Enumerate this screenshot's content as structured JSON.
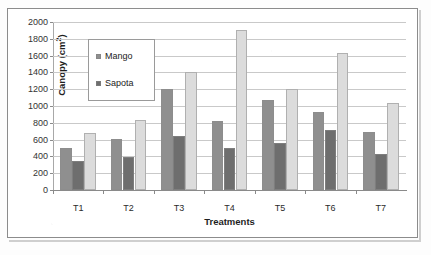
{
  "chart_data": {
    "type": "bar",
    "title": "",
    "xlabel": "Treatments",
    "ylabel": "Canopy (cm²)",
    "ylim": [
      0,
      2000
    ],
    "ytick_step": 200,
    "yticks": [
      0,
      200,
      400,
      600,
      800,
      1000,
      1200,
      1400,
      1600,
      1800,
      2000
    ],
    "grid": true,
    "grid_axis": "y",
    "legend_position": "upper-left-inside",
    "categories": [
      "T1",
      "T2",
      "T3",
      "T4",
      "T5",
      "T6",
      "T7"
    ],
    "series": [
      {
        "name": "Mango",
        "color": "#8f8f8f",
        "values": [
          505,
          605,
          1200,
          825,
          1070,
          930,
          690
        ]
      },
      {
        "name": "Sapota",
        "color": "#6e6e6e",
        "values": [
          340,
          390,
          640,
          505,
          555,
          715,
          430
        ]
      },
      {
        "name": "",
        "color": "#dcdcdc",
        "values": [
          680,
          830,
          1410,
          1910,
          1200,
          1630,
          1040
        ]
      }
    ],
    "legend_entries": [
      {
        "label": "Mango",
        "color": "#8f8f8f"
      },
      {
        "label": "Sapota",
        "color": "#6e6e6e"
      }
    ]
  },
  "colors": {
    "frame": "#8c8c8c",
    "gridline": "#c9c9c9",
    "axis": "#8a8a8a",
    "background": "#ffffff"
  }
}
